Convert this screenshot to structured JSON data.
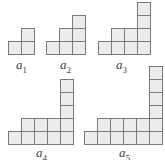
{
  "colors": {
    "cell_fill": "#ececec",
    "cell_stroke": "#7a7a7a",
    "label": "#444444"
  },
  "cell_size": 13,
  "figures": [
    {
      "name": "a",
      "index": "1",
      "column_heights": [
        1,
        2
      ],
      "origin": [
        8,
        54
      ],
      "label_pos": [
        16,
        58
      ]
    },
    {
      "name": "a",
      "index": "2",
      "column_heights": [
        1,
        2,
        3
      ],
      "origin": [
        46,
        54
      ],
      "label_pos": [
        60,
        58
      ]
    },
    {
      "name": "a",
      "index": "3",
      "column_heights": [
        1,
        2,
        2,
        4
      ],
      "origin": [
        98,
        54
      ],
      "label_pos": [
        116,
        58
      ]
    },
    {
      "name": "a",
      "index": "4",
      "column_heights": [
        1,
        2,
        2,
        2,
        5
      ],
      "origin": [
        8,
        144
      ],
      "label_pos": [
        36,
        146
      ]
    },
    {
      "name": "a",
      "index": "5",
      "column_heights": [
        1,
        2,
        2,
        2,
        2,
        6
      ],
      "origin": [
        84,
        144
      ],
      "label_pos": [
        119,
        146
      ]
    }
  ]
}
